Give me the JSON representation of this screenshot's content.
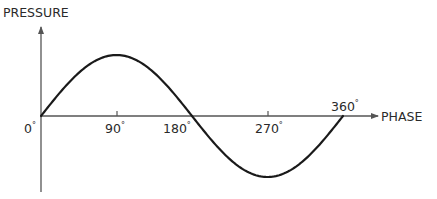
{
  "diagram": {
    "y_axis": {
      "label": "PRESSURE"
    },
    "x_axis": {
      "label": "PHASE",
      "ticks": [
        {
          "value": 0,
          "label": "0",
          "degree": "°"
        },
        {
          "value": 90,
          "label": "90",
          "degree": "°"
        },
        {
          "value": 180,
          "label": "180",
          "degree": "°"
        },
        {
          "value": 270,
          "label": "270",
          "degree": "°"
        },
        {
          "value": 360,
          "label": "360",
          "degree": "°"
        }
      ]
    },
    "curve": {
      "shape": "sine",
      "start_phase_deg": 0,
      "end_phase_deg": 360,
      "peak_phase_deg": 90,
      "trough_phase_deg": 270,
      "zero_crossings_deg": [
        0,
        180,
        360
      ]
    },
    "colors": {
      "axis": "#555555",
      "curve": "#1a1a1a",
      "text": "#2a2a2a",
      "background": "#ffffff"
    }
  }
}
